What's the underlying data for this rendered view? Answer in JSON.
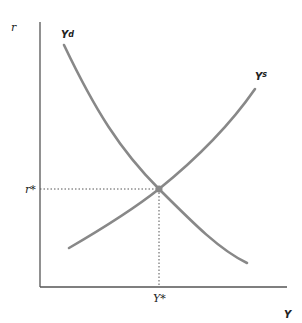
{
  "diagram": {
    "type": "supply-demand",
    "axes": {
      "y_label": "r",
      "x_label": "Y"
    },
    "curves": [
      {
        "name": "Yd",
        "label_base": "Y",
        "label_sup": "d",
        "shape": "downward-sloping convex"
      },
      {
        "name": "Ys",
        "label_base": "Y",
        "label_sup": "s",
        "shape": "upward-sloping"
      }
    ],
    "equilibrium": {
      "r_label": "r*",
      "y_label": "Y*"
    },
    "colors": {
      "curve": "#888888",
      "axis": "#555555",
      "dotted": "#555555",
      "point": "#888888"
    }
  }
}
